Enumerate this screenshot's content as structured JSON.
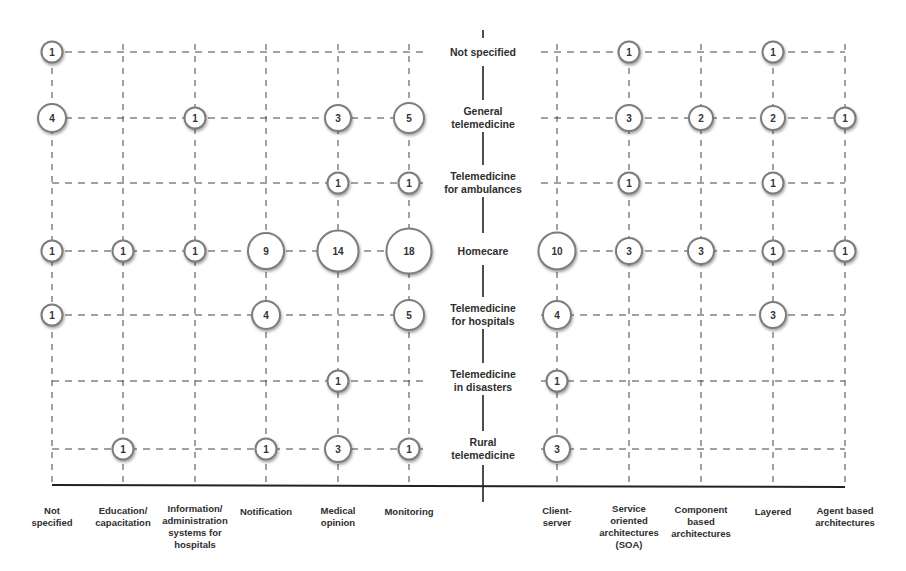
{
  "chart_data": {
    "type": "bubble",
    "title": "",
    "rows": [
      "Not specified",
      "General\ntelemedicine",
      "Telemedicine\nfor ambulances",
      "Homecare",
      "Telemedicine\nfor hospitals",
      "Telemedicine\nin disasters",
      "Rural\ntelemedicine"
    ],
    "left_columns": [
      "Not\nspecified",
      "Education/\ncapacitation",
      "Information/\nadministration\nsystems for\nhospitals",
      "Notification",
      "Medical\nopinion",
      "Monitoring"
    ],
    "right_columns": [
      "Client-\nserver",
      "Service\noriented\narchitectures\n(SOA)",
      "Component\nbased\narchitectures",
      "Layered",
      "Agent based\narchitectures"
    ],
    "left_values": [
      [
        1,
        null,
        null,
        null,
        null,
        null
      ],
      [
        4,
        null,
        1,
        null,
        3,
        5
      ],
      [
        null,
        null,
        null,
        null,
        1,
        1
      ],
      [
        1,
        1,
        1,
        9,
        14,
        18
      ],
      [
        1,
        null,
        null,
        4,
        null,
        5
      ],
      [
        null,
        null,
        null,
        null,
        1,
        null
      ],
      [
        null,
        1,
        null,
        1,
        3,
        1
      ]
    ],
    "right_values": [
      [
        null,
        1,
        null,
        1,
        null
      ],
      [
        null,
        3,
        2,
        2,
        1
      ],
      [
        null,
        1,
        null,
        1,
        null
      ],
      [
        10,
        3,
        3,
        1,
        1
      ],
      [
        4,
        null,
        null,
        3,
        null
      ],
      [
        1,
        null,
        null,
        null,
        null
      ],
      [
        3,
        null,
        null,
        null,
        null
      ]
    ],
    "xlabel": "",
    "ylabel": "",
    "grid": true,
    "legend": null
  }
}
